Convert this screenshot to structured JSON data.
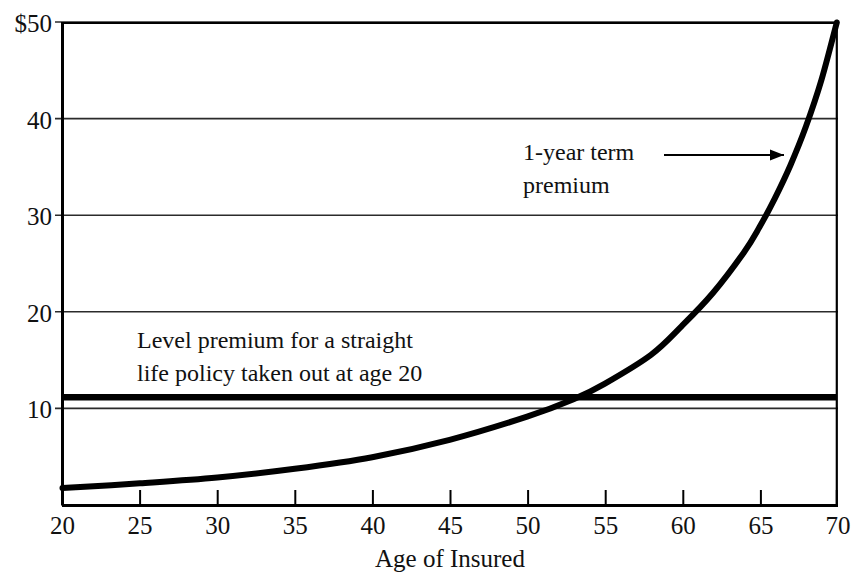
{
  "chart_data": {
    "type": "line",
    "title": "",
    "subtitle": "",
    "xlabel": "Age of Insured",
    "ylabel": "",
    "xlim": [
      20,
      70
    ],
    "ylim": [
      0,
      50
    ],
    "grid": "horizontal",
    "legend_position": "none",
    "x_ticks": [
      "20",
      "25",
      "30",
      "35",
      "40",
      "45",
      "50",
      "55",
      "60",
      "65",
      "70"
    ],
    "x_tick_values": [
      20,
      25,
      30,
      35,
      40,
      45,
      50,
      55,
      60,
      65,
      70
    ],
    "y_ticks": [
      "10",
      "20",
      "30",
      "40",
      "$50"
    ],
    "y_tick_values": [
      10,
      20,
      30,
      40,
      50
    ],
    "series": [
      {
        "name": "1-year term premium",
        "x": [
          20,
          25,
          30,
          35,
          40,
          45,
          50,
          53,
          55,
          58,
          60,
          62,
          64,
          65,
          66,
          67,
          68,
          69,
          70
        ],
        "values": [
          1.8,
          2.3,
          2.9,
          3.8,
          5.0,
          6.8,
          9.2,
          11.0,
          12.6,
          15.6,
          18.6,
          22.0,
          26.2,
          28.8,
          31.8,
          35.2,
          39.2,
          44.0,
          50.0
        ]
      },
      {
        "name": "Level premium for a straight life policy taken out at age 20",
        "x": [
          20,
          70
        ],
        "values": [
          11.2,
          11.2
        ]
      }
    ],
    "annotations": [
      {
        "id": "term-premium-annotation",
        "line1": "1-year term",
        "line2": "premium",
        "arrow": true,
        "arrow_points_to_series": "1-year term premium"
      },
      {
        "id": "level-premium-annotation",
        "line1": "Level premium for a straight",
        "line2": "life policy taken out at age 20",
        "arrow": false
      }
    ],
    "colors": {
      "curve": "#000000",
      "level_line": "#000000",
      "grid": "#333333",
      "axis": "#000000",
      "background": "#ffffff"
    }
  }
}
